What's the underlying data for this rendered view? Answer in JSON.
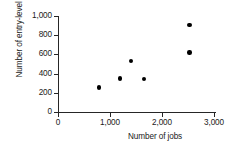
{
  "chart_data": {
    "type": "scatter",
    "title": "",
    "xlabel": "Number of jobs",
    "ylabel": "Number of entry-level jobs",
    "xlim": [
      0,
      3000
    ],
    "ylim": [
      0,
      1000
    ],
    "xticks": [
      0,
      1000,
      2000,
      3000
    ],
    "yticks": [
      0,
      200,
      400,
      600,
      800,
      1000
    ],
    "xticklabels": [
      "0",
      "1,000",
      "2,000",
      "3,000"
    ],
    "yticklabels": [
      "0",
      "200",
      "400",
      "600",
      "800",
      "1,000"
    ],
    "grid": false,
    "legend": false,
    "marker": "filled-circle",
    "marker_color": "#000000",
    "axis_color": "#262626",
    "background": "#ffffff",
    "points": [
      {
        "x": 790,
        "y": 255
      },
      {
        "x": 1190,
        "y": 350
      },
      {
        "x": 1400,
        "y": 530
      },
      {
        "x": 1650,
        "y": 345
      },
      {
        "x": 2530,
        "y": 620
      },
      {
        "x": 2530,
        "y": 905
      }
    ]
  }
}
